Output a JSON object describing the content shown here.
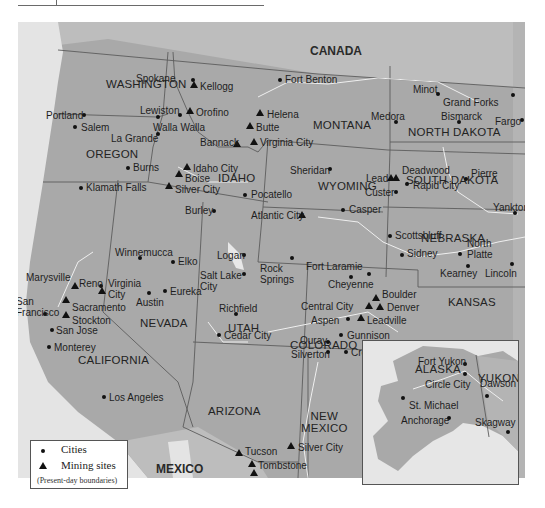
{
  "map": {
    "countries": {
      "canada": "CANADA",
      "mexico": "MEXICO"
    },
    "states": [
      {
        "name": "WASHINGTON",
        "x": 88,
        "y": 56
      },
      {
        "name": "OREGON",
        "x": 68,
        "y": 126
      },
      {
        "name": "IDAHO",
        "x": 200,
        "y": 150
      },
      {
        "name": "MONTANA",
        "x": 295,
        "y": 97
      },
      {
        "name": "WYOMING",
        "x": 300,
        "y": 158
      },
      {
        "name": "NORTH DAKOTA",
        "x": 390,
        "y": 104
      },
      {
        "name": "SOUTH DAKOTA",
        "x": 388,
        "y": 152
      },
      {
        "name": "NEBRASKA",
        "x": 403,
        "y": 210
      },
      {
        "name": "KANSAS",
        "x": 430,
        "y": 274
      },
      {
        "name": "NEVADA",
        "x": 122,
        "y": 295
      },
      {
        "name": "UTAH",
        "x": 210,
        "y": 300
      },
      {
        "name": "COLORADO",
        "x": 272,
        "y": 317
      },
      {
        "name": "CALIFORNIA",
        "x": 60,
        "y": 332
      },
      {
        "name": "ARIZONA",
        "x": 190,
        "y": 383
      },
      {
        "name": "NEW\nMEXICO",
        "x": 283,
        "y": 388
      }
    ],
    "cities": [
      {
        "name": "Spokane",
        "type": "city",
        "mx": 175,
        "my": 58,
        "lx": 118,
        "ly": 51
      },
      {
        "name": "Portland",
        "type": "city",
        "mx": 66,
        "my": 93,
        "lx": 28,
        "ly": 88
      },
      {
        "name": "Salem",
        "type": "city",
        "mx": 57,
        "my": 105,
        "lx": 63,
        "ly": 100
      },
      {
        "name": "Lewiston",
        "type": "city",
        "mx": 162,
        "my": 93,
        "lx": 122,
        "ly": 83
      },
      {
        "name": "Walla Walla",
        "type": "city",
        "mx": 140,
        "my": 95,
        "lx": 135,
        "ly": 100
      },
      {
        "name": "La Grande",
        "type": "city",
        "mx": 140,
        "my": 112,
        "lx": 93,
        "ly": 111
      },
      {
        "name": "Kellogg",
        "type": "mine",
        "mx": 176,
        "my": 63,
        "lx": 182,
        "ly": 59
      },
      {
        "name": "Orofino",
        "type": "mine",
        "mx": 172,
        "my": 89,
        "lx": 178,
        "ly": 85
      },
      {
        "name": "Fort Benton",
        "type": "city",
        "mx": 262,
        "my": 58,
        "lx": 267,
        "ly": 52
      },
      {
        "name": "Helena",
        "type": "mine",
        "mx": 242,
        "my": 91,
        "lx": 249,
        "ly": 87
      },
      {
        "name": "Butte",
        "type": "mine",
        "mx": 232,
        "my": 104,
        "lx": 238,
        "ly": 100
      },
      {
        "name": "Bannack",
        "type": "mine",
        "mx": 219,
        "my": 122,
        "lx": 182,
        "ly": 115
      },
      {
        "name": "Virginia City",
        "type": "mine",
        "mx": 236,
        "my": 120,
        "lx": 242,
        "ly": 115
      },
      {
        "name": "Minot",
        "type": "city",
        "mx": 420,
        "my": 72,
        "lx": 395,
        "ly": 62
      },
      {
        "name": "Grand Forks",
        "type": "city",
        "mx": 495,
        "my": 73,
        "lx": 425,
        "ly": 75
      },
      {
        "name": "Medora",
        "type": "city",
        "mx": 378,
        "my": 100,
        "lx": 353,
        "ly": 89
      },
      {
        "name": "Bismarck",
        "type": "city",
        "mx": 441,
        "my": 100,
        "lx": 423,
        "ly": 89
      },
      {
        "name": "Fargo",
        "type": "city",
        "mx": 504,
        "my": 98,
        "lx": 477,
        "ly": 94
      },
      {
        "name": "Idaho City",
        "type": "mine",
        "mx": 169,
        "my": 145,
        "lx": 175,
        "ly": 141
      },
      {
        "name": "Boise",
        "type": "mine",
        "mx": 161,
        "my": 152,
        "lx": 167,
        "ly": 151
      },
      {
        "name": "Silver City",
        "type": "mine",
        "mx": 151,
        "my": 164,
        "lx": 157,
        "ly": 162
      },
      {
        "name": "Burns",
        "type": "city",
        "mx": 110,
        "my": 146,
        "lx": 115,
        "ly": 140
      },
      {
        "name": "Klamath Falls",
        "type": "city",
        "mx": 63,
        "my": 166,
        "lx": 68,
        "ly": 160
      },
      {
        "name": "Pocatello",
        "type": "city",
        "mx": 227,
        "my": 173,
        "lx": 233,
        "ly": 167
      },
      {
        "name": "Burley",
        "type": "city",
        "mx": 196,
        "my": 189,
        "lx": 167,
        "ly": 183
      },
      {
        "name": "Atlantic City",
        "type": "mine",
        "mx": 284,
        "my": 193,
        "lx": 233,
        "ly": 188
      },
      {
        "name": "Sheridan",
        "type": "city",
        "mx": 312,
        "my": 147,
        "lx": 272,
        "ly": 143
      },
      {
        "name": "Casper",
        "type": "city",
        "mx": 325,
        "my": 188,
        "lx": 331,
        "ly": 182
      },
      {
        "name": "Lead",
        "type": "mine",
        "mx": 373,
        "my": 156,
        "lx": 348,
        "ly": 151
      },
      {
        "name": "Deadwood",
        "type": "mine",
        "mx": 378,
        "my": 156,
        "lx": 384,
        "ly": 143
      },
      {
        "name": "Custer",
        "type": "city",
        "mx": 378,
        "my": 170,
        "lx": 347,
        "ly": 165
      },
      {
        "name": "Rapid City",
        "type": "city",
        "mx": 389,
        "my": 162,
        "lx": 395,
        "ly": 158
      },
      {
        "name": "Pierre",
        "type": "city",
        "mx": 448,
        "my": 157,
        "lx": 453,
        "ly": 146
      },
      {
        "name": "Yankton",
        "type": "city",
        "mx": 497,
        "my": 191,
        "lx": 475,
        "ly": 180
      },
      {
        "name": "Scottsbluff",
        "type": "city",
        "mx": 372,
        "my": 214,
        "lx": 377,
        "ly": 208
      },
      {
        "name": "North\nPlatte",
        "type": "city",
        "mx": 442,
        "my": 232,
        "lx": 449,
        "ly": 216
      },
      {
        "name": "Sidney",
        "type": "city",
        "mx": 384,
        "my": 233,
        "lx": 389,
        "ly": 226
      },
      {
        "name": "Kearney",
        "type": "city",
        "mx": 450,
        "my": 244,
        "lx": 422,
        "ly": 246
      },
      {
        "name": "Lincoln",
        "type": "city",
        "mx": 494,
        "my": 242,
        "lx": 467,
        "ly": 246
      },
      {
        "name": "Winnemucca",
        "type": "city",
        "mx": 122,
        "my": 236,
        "lx": 97,
        "ly": 225
      },
      {
        "name": "Elko",
        "type": "city",
        "mx": 155,
        "my": 240,
        "lx": 160,
        "ly": 234
      },
      {
        "name": "Logan",
        "type": "city",
        "mx": 226,
        "my": 233,
        "lx": 199,
        "ly": 228
      },
      {
        "name": "Salt Lake\nCity",
        "type": "city",
        "mx": 226,
        "my": 252,
        "lx": 182,
        "ly": 248
      },
      {
        "name": "Rock\nSprings",
        "type": "city",
        "mx": 274,
        "my": 236,
        "lx": 242,
        "ly": 241
      },
      {
        "name": "Fort Laramie",
        "type": "city",
        "mx": 333,
        "my": 255,
        "lx": 288,
        "ly": 239
      },
      {
        "name": "Cheyenne",
        "type": "city",
        "mx": 351,
        "my": 252,
        "lx": 310,
        "ly": 257
      },
      {
        "name": "Marysville",
        "type": "mine",
        "mx": 57,
        "my": 264,
        "lx": 8,
        "ly": 250
      },
      {
        "name": "Reno",
        "type": "city",
        "mx": 83,
        "my": 264,
        "lx": 61,
        "ly": 256
      },
      {
        "name": "Virginia\nCity",
        "type": "mine",
        "mx": 84,
        "my": 269,
        "lx": 90,
        "ly": 256
      },
      {
        "name": "Austin",
        "type": "city",
        "mx": 131,
        "my": 271,
        "lx": 118,
        "ly": 275
      },
      {
        "name": "Eureka",
        "type": "city",
        "mx": 147,
        "my": 269,
        "lx": 152,
        "ly": 264
      },
      {
        "name": "San\nFrancisco",
        "type": "city",
        "mx": 27,
        "my": 292,
        "lx": -2,
        "ly": 274
      },
      {
        "name": "Sacramento",
        "type": "mine",
        "mx": 48,
        "my": 278,
        "lx": 54,
        "ly": 280
      },
      {
        "name": "Stockton",
        "type": "mine",
        "mx": 48,
        "my": 293,
        "lx": 54,
        "ly": 293
      },
      {
        "name": "San Jose",
        "type": "city",
        "mx": 34,
        "my": 308,
        "lx": 38,
        "ly": 303
      },
      {
        "name": "Monterey",
        "type": "city",
        "mx": 31,
        "my": 325,
        "lx": 36,
        "ly": 320
      },
      {
        "name": "Richfield",
        "type": "city",
        "mx": 218,
        "my": 292,
        "lx": 201,
        "ly": 281
      },
      {
        "name": "Cedar City",
        "type": "city",
        "mx": 201,
        "my": 313,
        "lx": 206,
        "ly": 308
      },
      {
        "name": "Boulder",
        "type": "mine",
        "mx": 358,
        "my": 276,
        "lx": 364,
        "ly": 267
      },
      {
        "name": "Central City",
        "type": "mine",
        "mx": 351,
        "my": 284,
        "lx": 283,
        "ly": 279
      },
      {
        "name": "Denver",
        "type": "mine",
        "mx": 362,
        "my": 285,
        "lx": 369,
        "ly": 280
      },
      {
        "name": "Aspen",
        "type": "city",
        "mx": 330,
        "my": 297,
        "lx": 293,
        "ly": 293
      },
      {
        "name": "Leadville",
        "type": "mine",
        "mx": 343,
        "my": 296,
        "lx": 349,
        "ly": 293
      },
      {
        "name": "Gunnison",
        "type": "city",
        "mx": 323,
        "my": 313,
        "lx": 329,
        "ly": 308
      },
      {
        "name": "Ouray",
        "type": "city",
        "mx": 310,
        "my": 320,
        "lx": 282,
        "ly": 313
      },
      {
        "name": "Silverton",
        "type": "city",
        "mx": 310,
        "my": 330,
        "lx": 273,
        "ly": 327
      },
      {
        "name": "Creede",
        "type": "city",
        "mx": 328,
        "my": 330,
        "lx": 333,
        "ly": 325
      },
      {
        "name": "Los Angeles",
        "type": "city",
        "mx": 86,
        "my": 375,
        "lx": 91,
        "ly": 370
      },
      {
        "name": "Tucson",
        "type": "mine",
        "mx": 221,
        "my": 431,
        "lx": 227,
        "ly": 424
      },
      {
        "name": "Tombstone",
        "type": "mine",
        "mx": 234,
        "my": 442,
        "lx": 240,
        "ly": 438
      },
      {
        "name": "Bisbee",
        "type": "mine",
        "mx": 236,
        "my": 451,
        "lx": 224,
        "ly": 458
      },
      {
        "name": "Silver City",
        "type": "mine",
        "mx": 273,
        "my": 424,
        "lx": 280,
        "ly": 420
      }
    ],
    "inset": {
      "alaska_label": "ALASKA",
      "yukon_label": "YUKON",
      "places": [
        {
          "name": "Fort Yukon",
          "mx": 102,
          "my": 23,
          "lx": 55,
          "ly": 15
        },
        {
          "name": "Circle City",
          "mx": 102,
          "my": 33,
          "lx": 62,
          "ly": 38
        },
        {
          "name": "Dawson",
          "mx": 124,
          "my": 55,
          "lx": 117,
          "ly": 37
        },
        {
          "name": "St. Michael",
          "mx": 40,
          "my": 57,
          "lx": 46,
          "ly": 59
        },
        {
          "name": "Anchorage",
          "mx": 86,
          "my": 77,
          "lx": 38,
          "ly": 74
        },
        {
          "name": "Skagway",
          "mx": 145,
          "my": 91,
          "lx": 112,
          "ly": 76
        }
      ]
    }
  },
  "legend": {
    "cities_label": "Cities",
    "mining_label": "Mining sites",
    "note": "(Present-day boundaries)"
  },
  "colors": {
    "land_us": "#a9a9a9",
    "land_foreign": "#bdbdbd",
    "water": "#e4e4e4",
    "borders": "#5c5c5c",
    "rivers": "#efefef",
    "markers": "#111111"
  }
}
